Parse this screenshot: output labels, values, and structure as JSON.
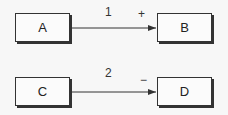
{
  "diagram": {
    "nodes": [
      {
        "id": "A",
        "label": "A"
      },
      {
        "id": "B",
        "label": "B"
      },
      {
        "id": "C",
        "label": "C"
      },
      {
        "id": "D",
        "label": "D"
      }
    ],
    "edges": [
      {
        "from": "A",
        "to": "B",
        "label": "1",
        "sign": "+"
      },
      {
        "from": "C",
        "to": "D",
        "label": "2",
        "sign": "−"
      }
    ]
  }
}
